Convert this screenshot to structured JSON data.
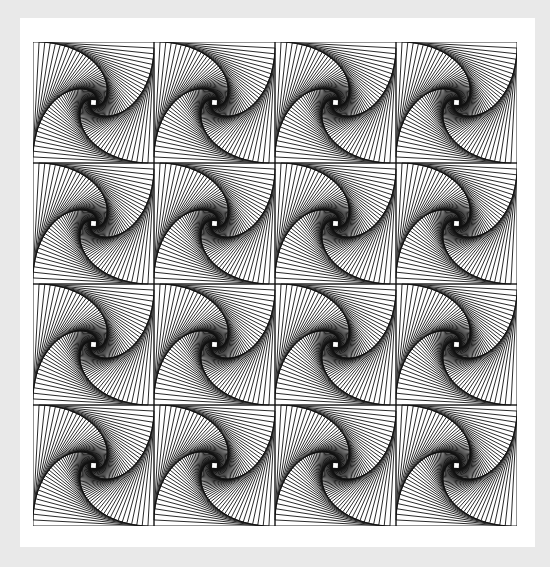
{
  "artwork": {
    "title": "Spiraling nested squares tessellation",
    "background_color": "#e9e9e9",
    "panel_color": "#ffffff",
    "stroke_color": "#111111",
    "grid": {
      "rows": 4,
      "cols": 4,
      "cell_size": 121
    },
    "square": {
      "step_fraction": 0.05,
      "iterations": 62,
      "stroke_width": 0.9,
      "rotation": "clockwise"
    }
  }
}
